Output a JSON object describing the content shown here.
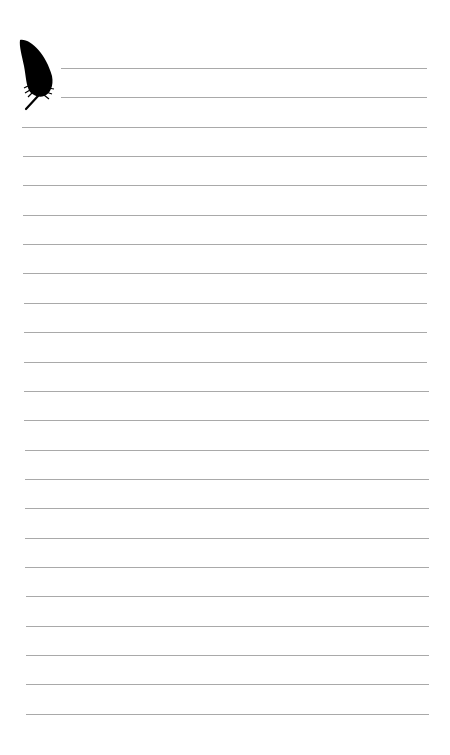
{
  "page": {
    "type": "lined-notepaper",
    "background": "#ffffff",
    "line_color": "#a9a9a9",
    "first_line_y": 68,
    "line_spacing": 29.35,
    "line_count": 23,
    "short_lines": 2,
    "short_line_left": 61,
    "full_line_left": 22,
    "line_right": 427
  },
  "decoration": {
    "icon": "feather-icon",
    "color": "#000000"
  }
}
